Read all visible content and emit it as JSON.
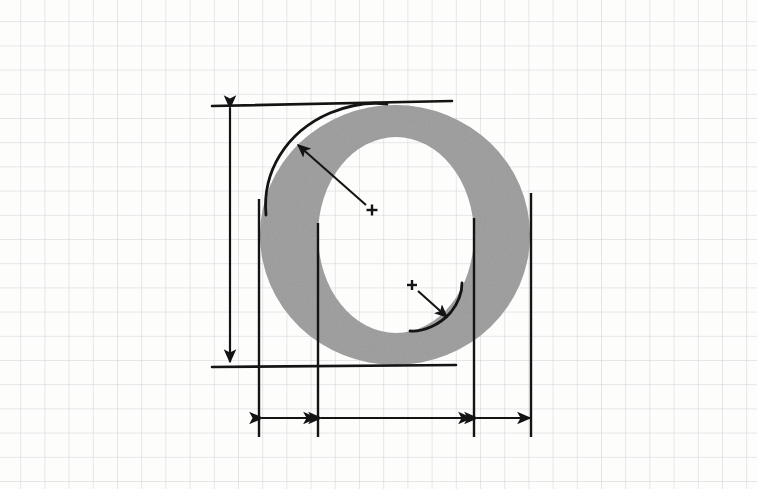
{
  "canvas": {
    "width": 757,
    "height": 489,
    "background_color": "#fdfdfc",
    "title": "Letterform O construction analysis on graph paper"
  },
  "grid": {
    "type": "graph-paper",
    "cell_size_px": 24.2,
    "line_color": "#c8ccd0",
    "line_width_px": 0.9,
    "origin_offset_x": -4,
    "origin_offset_y": -3,
    "visible": true
  },
  "glyph": {
    "character": "O",
    "description": "Capital letter O, high-contrast serif-style ellipse with thick vertical stems and thin horizontal joins",
    "fill_color": "#9b9b9b",
    "stroke_color": "none",
    "outer": {
      "center_x": 395,
      "center_y": 235,
      "radius_x": 135,
      "radius_y": 130
    },
    "inner": {
      "center_x": 396,
      "center_y": 235,
      "radius_x": 78,
      "radius_y": 98
    }
  },
  "annotations": {
    "ink_color": "#141414",
    "reference_lines": [
      {
        "name": "cap-height-line",
        "orientation": "horizontal",
        "x1": 212,
        "y1": 106,
        "x2": 452,
        "y2": 101,
        "stroke_width": 2.6
      },
      {
        "name": "baseline",
        "orientation": "horizontal",
        "x1": 212,
        "y1": 367,
        "x2": 456,
        "y2": 365,
        "stroke_width": 2.6
      }
    ],
    "vertical_dimension": {
      "name": "cap-height-dimension",
      "label": "cap height",
      "x": 230,
      "y_top": 104,
      "y_bottom": 366,
      "arrow_heads": "both",
      "stroke_width": 2.2
    },
    "extension_lines": [
      {
        "name": "extension-line-left-outer",
        "x": 259,
        "y_top": 199,
        "y_bottom": 437,
        "stroke_width": 2.4
      },
      {
        "name": "extension-line-left-inner",
        "x": 318,
        "y_top": 223,
        "y_bottom": 437,
        "stroke_width": 2.4
      },
      {
        "name": "extension-line-right-inner",
        "x": 474,
        "y_top": 218,
        "y_bottom": 437,
        "stroke_width": 2.4
      },
      {
        "name": "extension-line-right-outer",
        "x": 531,
        "y_top": 193,
        "y_bottom": 437,
        "stroke_width": 2.4
      }
    ],
    "horizontal_dimensions": [
      {
        "name": "left-stem-width-dimension",
        "label": "left stem width",
        "x1": 261,
        "x2": 317,
        "y": 418,
        "arrow_heads": "both",
        "stroke_width": 2.2
      },
      {
        "name": "counter-width-dimension",
        "label": "counter width",
        "x1": 320,
        "x2": 472,
        "y": 418,
        "arrow_heads": "both",
        "stroke_width": 2.2
      },
      {
        "name": "right-stem-width-dimension",
        "label": "right stem width",
        "x1": 476,
        "x2": 531,
        "y": 418,
        "arrow_heads": "both",
        "stroke_width": 2.2
      }
    ],
    "radius_callouts": [
      {
        "name": "outer-arc-callout",
        "label": "outer bowl radius",
        "center_mark": {
          "x": 372,
          "y": 210,
          "size": 11
        },
        "arrow": {
          "x1": 366,
          "y1": 205,
          "x2": 298,
          "y2": 145
        },
        "arc": {
          "path": "M 266 215 C 262 172 286 132 330 113 C 352 104 372 102 387 104",
          "stroke_width": 2.8
        }
      },
      {
        "name": "inner-arc-callout",
        "label": "inner counter radius",
        "center_mark": {
          "x": 412,
          "y": 285,
          "size": 10
        },
        "arrow": {
          "x1": 418,
          "y1": 291,
          "x2": 447,
          "y2": 317
        },
        "arc": {
          "path": "M 410 331 C 423 332 440 325 451 312 C 459 302 462 292 462 283",
          "stroke_width": 2.8
        }
      }
    ]
  },
  "legend": {
    "visible": false,
    "items": []
  }
}
